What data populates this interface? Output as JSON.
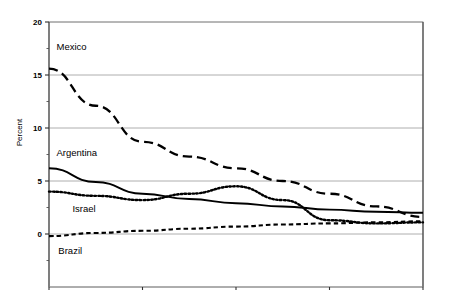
{
  "chart_data": {
    "type": "line",
    "title": "",
    "subtitle": "",
    "xlabel": "Number of months after program implementation",
    "ylabel": "Percent",
    "xlim": [
      1,
      5
    ],
    "ylim": [
      0,
      20
    ],
    "xticks": [
      "1",
      "2",
      "3",
      "4",
      "5"
    ],
    "yticks": [
      "0",
      "5",
      "10",
      "15",
      "20"
    ],
    "grid": true,
    "legend_position": "inline-annotations",
    "x": [
      1,
      1.5,
      2,
      2.5,
      3,
      3.5,
      4,
      4.5,
      5
    ],
    "series": [
      {
        "name": "Mexico",
        "label": "Mexico",
        "style": "long-dash",
        "color": "#000000",
        "values": [
          15.6,
          12.1,
          8.7,
          7.3,
          6.2,
          5.0,
          3.8,
          2.6,
          1.6
        ]
      },
      {
        "name": "Argentina",
        "label": "Argentina",
        "style": "solid",
        "color": "#000000",
        "values": [
          6.2,
          4.9,
          3.8,
          3.3,
          2.9,
          2.6,
          2.3,
          2.1,
          2.0
        ]
      },
      {
        "name": "Israel",
        "label": "Israel",
        "style": "dotted",
        "color": "#000000",
        "values": [
          4.0,
          3.6,
          3.2,
          3.8,
          4.5,
          3.2,
          1.3,
          1.0,
          1.1
        ]
      },
      {
        "name": "Brazil",
        "label": "Brazil",
        "style": "short-dash",
        "color": "#000000",
        "values": [
          -0.2,
          0.1,
          0.3,
          0.5,
          0.7,
          0.9,
          1.0,
          1.1,
          1.2
        ]
      }
    ],
    "annotations": [
      {
        "text": "Mexico",
        "x": 1.08,
        "y": 17.6
      },
      {
        "text": "Argentina",
        "x": 1.08,
        "y": 7.6
      },
      {
        "text": "Israel",
        "x": 1.25,
        "y": 2.4
      },
      {
        "text": "Brazil",
        "x": 1.1,
        "y": -1.6
      }
    ]
  }
}
